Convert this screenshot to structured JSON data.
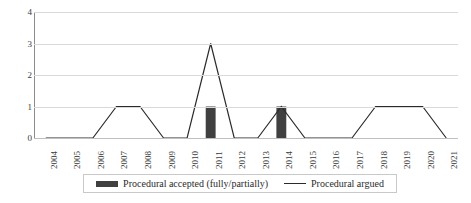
{
  "chart_data": {
    "type": "line",
    "title": "",
    "xlabel": "",
    "ylabel": "",
    "ylim": [
      0,
      4
    ],
    "yticks": [
      "0",
      "1",
      "2",
      "3",
      "4"
    ],
    "grid": true,
    "legend_position": "bottom",
    "categories": [
      "2004",
      "2005",
      "2006",
      "2007",
      "2008",
      "2009",
      "2010",
      "2011",
      "2012",
      "2013",
      "2014",
      "2015",
      "2016",
      "2017",
      "2018",
      "2019",
      "2020",
      "2021"
    ],
    "series": [
      {
        "name": "Procedural accepted (fully/partially)",
        "type": "bar",
        "color": "#404040",
        "values": [
          0,
          0,
          0,
          0,
          0,
          0,
          0,
          1,
          0,
          0,
          1,
          0,
          0,
          0,
          0,
          0,
          0,
          0
        ]
      },
      {
        "name": "Procedural argued",
        "type": "line",
        "color": "#2b2b2b",
        "values": [
          0,
          0,
          0,
          1,
          1,
          0,
          0,
          3,
          0,
          0,
          1,
          0,
          0,
          0,
          1,
          1,
          1,
          0
        ]
      }
    ]
  },
  "legend": {
    "entries": [
      {
        "label": "Procedural accepted (fully/partially)",
        "marker": "bar-swatch-icon"
      },
      {
        "label": "Procedural argued",
        "marker": "line-swatch-icon"
      }
    ]
  }
}
